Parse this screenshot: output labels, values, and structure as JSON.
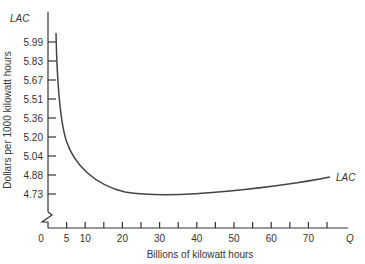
{
  "chart_data": {
    "type": "line",
    "title": "",
    "xlabel": "Billions of kilowatt hours",
    "ylabel": "Dollars per 1000 kilowatt hours",
    "x_axis_symbol": "Q",
    "y_axis_symbol": "LAC",
    "x_ticks": [
      "0",
      "5",
      "10",
      "20",
      "30",
      "40",
      "50",
      "60",
      "70"
    ],
    "y_ticks": [
      "5.99",
      "5.83",
      "5.67",
      "5.51",
      "5.36",
      "5.20",
      "5.04",
      "4.88",
      "4.73"
    ],
    "axis_break": "y-axis break between 0 and 4.73",
    "grid": false,
    "series": [
      {
        "name": "LAC",
        "x": [
          2,
          3,
          5,
          8,
          10,
          15,
          20,
          25,
          30,
          40,
          50,
          60,
          70,
          75
        ],
        "y": [
          6.05,
          5.6,
          5.15,
          4.98,
          4.92,
          4.8,
          4.74,
          4.73,
          4.73,
          4.74,
          4.76,
          4.8,
          4.85,
          4.88
        ]
      }
    ],
    "curve_label": "LAC",
    "ylim": [
      4.73,
      6.05
    ],
    "xlim": [
      0,
      78
    ]
  }
}
